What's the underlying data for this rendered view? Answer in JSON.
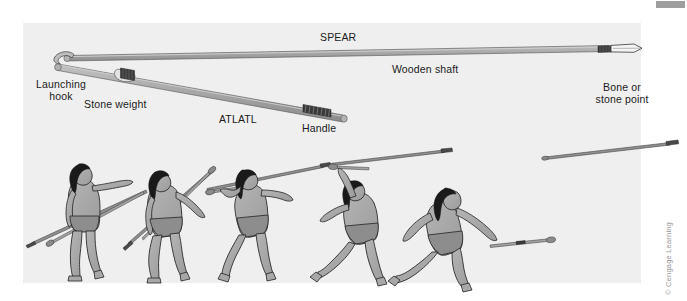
{
  "figure": {
    "panel_bg": "#efefef",
    "credit": "© Cengage Learning",
    "labels": {
      "spear": "SPEAR",
      "wooden_shaft": "Wooden shaft",
      "bone_or_stone_point_line1": "Bone or",
      "bone_or_stone_point_line2": "stone point",
      "launching_hook_line1": "Launching",
      "launching_hook_line2": "hook",
      "stone_weight": "Stone weight",
      "atlatl": "ATLATL",
      "handle": "Handle"
    },
    "colors": {
      "shaft_fill": "#a8a8a8",
      "shaft_dark": "#6e6e6e",
      "binding": "#3a3a3a",
      "point_fill": "#f2f2f2",
      "skin_fill": "#a6a6a6",
      "hair_fill": "#1c1c1c",
      "loincloth": "#8c8c8c",
      "outline": "#222222",
      "marker_bar": "#9e9e9e"
    },
    "throw_sequence": {
      "count": 5,
      "poses": [
        "standing-ready-spear-level",
        "crouching-cocking-back",
        "striding-arm-raising",
        "lunging-arm-overhead-release",
        "follow-through-arm-extended"
      ]
    },
    "flying_spears": [
      "spear-released-mid-air-left",
      "spear-released-mid-air-right"
    ]
  }
}
